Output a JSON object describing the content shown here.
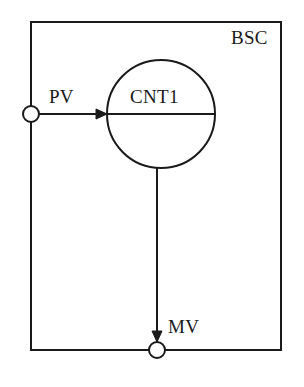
{
  "diagram": {
    "type": "control-block-diagram",
    "title": "BSC",
    "block": {
      "name": "BSC",
      "label": "BSC",
      "shape": "rectangle",
      "x": 31,
      "y": 22,
      "width": 250,
      "height": 328
    },
    "function_block": {
      "name": "CNT1",
      "label": "CNT1",
      "shape": "circle-with-horizontal-diameter",
      "cx": 161,
      "cy": 114,
      "r": 54
    },
    "ports": [
      {
        "name": "PV",
        "label": "PV",
        "role": "input",
        "shape": "small-open-circle",
        "cx": 31,
        "cy": 114,
        "r": 8,
        "on_edge": "left"
      },
      {
        "name": "MV",
        "label": "MV",
        "role": "output",
        "shape": "small-open-circle",
        "cx": 157,
        "cy": 350,
        "r": 8,
        "on_edge": "bottom"
      }
    ],
    "connections": [
      {
        "name": "pv-to-cnt1",
        "from": "PV",
        "to": "CNT1",
        "direction": "horizontal-right",
        "arrowhead": "at-target"
      },
      {
        "name": "cnt1-to-mv",
        "from": "CNT1",
        "to": "MV",
        "direction": "vertical-down",
        "arrowhead": "at-target"
      }
    ],
    "colors": {
      "stroke": "#1a1a1a",
      "background": "#ffffff",
      "text": "#1a1a1a"
    }
  }
}
